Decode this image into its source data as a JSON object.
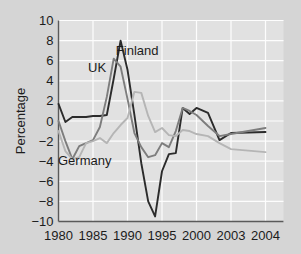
{
  "chart_data": {
    "type": "line",
    "title": "",
    "subtitle": "",
    "xlabel": "",
    "ylabel": "Percentage",
    "xlim": [
      1980,
      2004
    ],
    "ylim": [
      -10,
      10
    ],
    "grid": true,
    "legend_position": "inline-annotations",
    "xticks": [
      "1980",
      "1985",
      "1990",
      "1995",
      "2000",
      "2003",
      "2004"
    ],
    "xtick_values": [
      1980,
      1985,
      1990,
      1995,
      2000,
      2003,
      2004
    ],
    "yticks": [
      "10",
      "8",
      "6",
      "4",
      "2",
      "0",
      "-2",
      "-4",
      "-6",
      "-8",
      "-10"
    ],
    "ytick_values": [
      10,
      8,
      6,
      4,
      2,
      0,
      -2,
      -4,
      -6,
      -8,
      -10
    ],
    "x": [
      1980,
      1981,
      1982,
      1983,
      1984,
      1985,
      1986,
      1987,
      1988,
      1989,
      1990,
      1991,
      1992,
      1993,
      1994,
      1995,
      1996,
      1997,
      1998,
      1999,
      2000,
      2001,
      2002,
      2003,
      2004
    ],
    "series": [
      {
        "name": "Finland",
        "color": "#2b2b2b",
        "label_x": 1991.4,
        "label_y": 6.6,
        "values": [
          1.7,
          -0.1,
          0.4,
          0.4,
          0.4,
          0.5,
          0.5,
          0.6,
          4.2,
          8.0,
          5.1,
          0.6,
          -4.2,
          -8.0,
          -9.5,
          -5.0,
          -3.3,
          -3.2,
          1.3,
          0.7,
          1.3,
          0.8,
          -1.9,
          -1.2,
          -1.1
        ]
      },
      {
        "name": "UK",
        "color": "#7d7d7d",
        "label_x": 1985.6,
        "label_y": 4.9,
        "values": [
          0.0,
          -2.0,
          -3.8,
          -2.5,
          -2.2,
          -1.9,
          -0.6,
          2.4,
          6.2,
          5.4,
          2.2,
          -1.2,
          -2.6,
          -3.6,
          -3.4,
          -2.2,
          -2.6,
          -1.0,
          1.3,
          1.0,
          0.6,
          -0.5,
          -1.5,
          -1.3,
          -0.7
        ]
      },
      {
        "name": "Germany",
        "color": "#b5b5b5",
        "label_x": 1983.8,
        "label_y": -4.4,
        "values": [
          -1.0,
          -3.0,
          -3.8,
          -3.6,
          -2.2,
          -2.0,
          -1.7,
          -2.2,
          -1.2,
          -0.4,
          0.3,
          2.9,
          2.8,
          0.5,
          -1.1,
          -0.7,
          -1.4,
          -1.5,
          -0.9,
          -1.0,
          -1.3,
          -1.5,
          -2.2,
          -2.8,
          -3.1
        ]
      }
    ]
  },
  "figure": {
    "background_color": "#d5d5d5",
    "plot_background_color": "#e1e1e1",
    "grid_color": "#fdfdfd",
    "axis_color": "#5a5a5a"
  }
}
